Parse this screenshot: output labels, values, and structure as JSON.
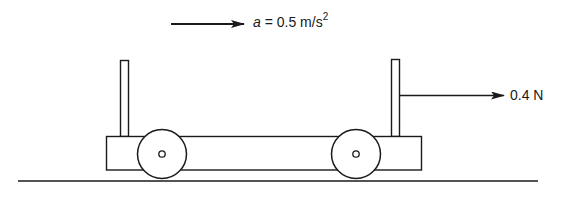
{
  "diagram": {
    "acceleration": {
      "symbol": "a",
      "equals": " = ",
      "value": "0.5 m/s",
      "exponent": "2",
      "direction": "right"
    },
    "force": {
      "label": "0.4 N",
      "direction": "right",
      "applied_to": "right post"
    },
    "cart": {
      "wheels": 2,
      "posts": 2
    },
    "colors": {
      "stroke": "#1a1a1a",
      "background": "#ffffff"
    }
  }
}
